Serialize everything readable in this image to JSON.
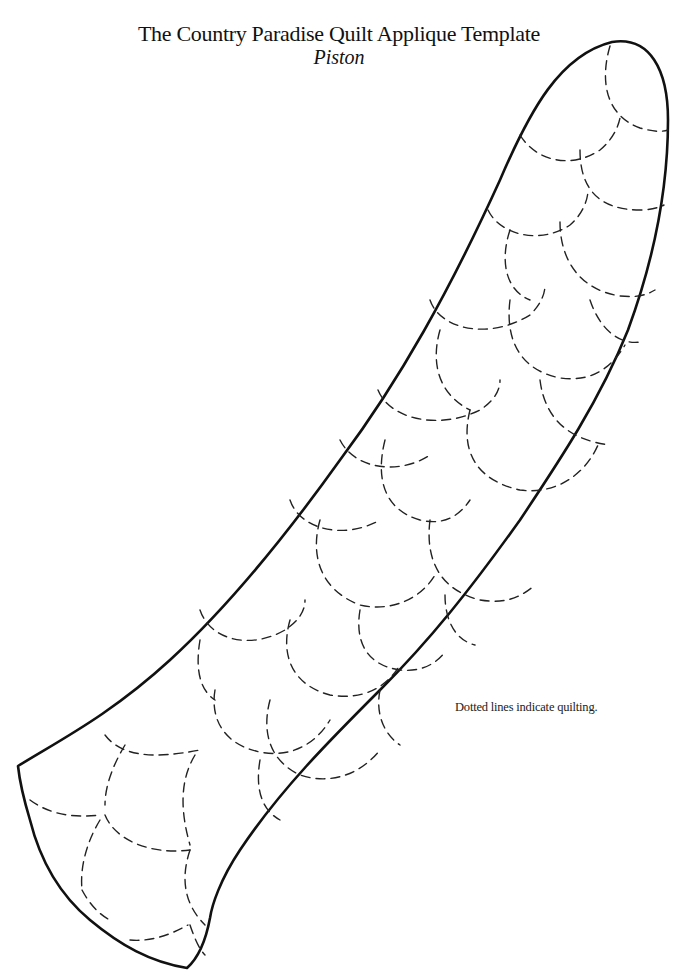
{
  "document": {
    "title": "The Country Paradise Quilt Applique Template",
    "subtitle": "Piston",
    "note": "Dotted lines indicate quilting."
  },
  "template": {
    "shape": "piston",
    "outline_style": "solid",
    "quilting_style": "dashed scallops",
    "colors": {
      "ink": "#111111",
      "background": "#ffffff"
    }
  }
}
